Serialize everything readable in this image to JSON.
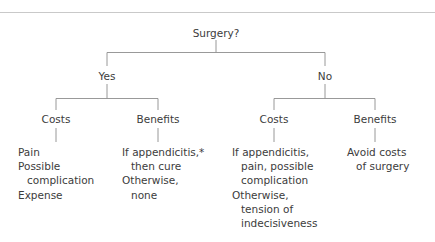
{
  "figure": {
    "root": {
      "label": "Surgery?"
    },
    "branches": [
      {
        "label": "Yes"
      },
      {
        "label": "No"
      }
    ],
    "categories": [
      {
        "label": "Costs"
      },
      {
        "label": "Benefits"
      },
      {
        "label": "Costs"
      },
      {
        "label": "Benefits"
      }
    ],
    "leaves": [
      {
        "name": "yes-costs",
        "lines": [
          {
            "text": "Pain",
            "indent": false
          },
          {
            "text": "Possible",
            "indent": false
          },
          {
            "text": "complication",
            "indent": true
          },
          {
            "text": "Expense",
            "indent": false
          }
        ]
      },
      {
        "name": "yes-benefits",
        "lines": [
          {
            "text": "If appendicitis,*",
            "indent": false
          },
          {
            "text": "then cure",
            "indent": true
          },
          {
            "text": "Otherwise,",
            "indent": false
          },
          {
            "text": "none",
            "indent": true
          }
        ]
      },
      {
        "name": "no-costs",
        "lines": [
          {
            "text": "If appendicitis,",
            "indent": false
          },
          {
            "text": "pain, possible",
            "indent": true
          },
          {
            "text": "complication",
            "indent": true
          },
          {
            "text": "Otherwise,",
            "indent": false
          },
          {
            "text": "tension of",
            "indent": true
          },
          {
            "text": "indecisiveness",
            "indent": true
          }
        ]
      },
      {
        "name": "no-benefits",
        "lines": [
          {
            "text": "Avoid costs",
            "indent": false
          },
          {
            "text": "of surgery",
            "indent": true
          }
        ]
      }
    ],
    "colors": {
      "text": "#3c3c3c",
      "line": "#8d8d8d",
      "rule": "#c9c9c9",
      "background": "#ffffff"
    }
  }
}
